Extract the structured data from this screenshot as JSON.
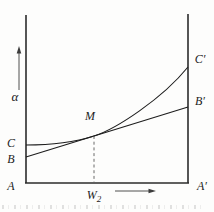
{
  "figure": {
    "y_axis": {
      "label": "α",
      "arrow_icon": "up-arrow"
    },
    "x_axis": {
      "marker_base": "W",
      "marker_sub": "2",
      "arrow_icon": "right-arrow"
    },
    "labels": {
      "A": "A",
      "B": "B",
      "C": "C",
      "M": "M",
      "A_prime": "A′",
      "B_prime": "B′",
      "C_prime": "C′"
    },
    "curves": [
      {
        "name": "line-BB-prime",
        "type": "straight",
        "from": "B",
        "to": "B′",
        "tangent_at": "M"
      },
      {
        "name": "curve-CC-prime",
        "type": "convex",
        "from": "C",
        "to": "C′",
        "tangent_at": "M"
      }
    ],
    "guide": {
      "style": "dashed",
      "from": "M",
      "to_marker": "W₂"
    }
  },
  "colors": {
    "axis": "#2b2b2b",
    "stroke": "#1d1d1d",
    "dashed": "#5a5a5a",
    "arrow": "#3c3c3c",
    "label": "#1c1c1c",
    "background": "#fdfdfc"
  }
}
